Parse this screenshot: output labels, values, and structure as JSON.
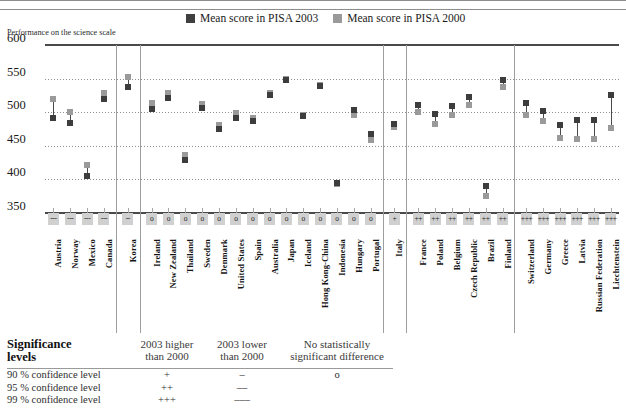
{
  "header": {
    "title_clipped": "",
    "axis_title": "Performance on the science scale"
  },
  "legend": {
    "items": [
      {
        "label": "Mean score in PISA 2003",
        "color": "#3f3f3f",
        "icon": "square-swatch-dark"
      },
      {
        "label": "Mean score in PISA 2000",
        "color": "#9a9a9a",
        "icon": "square-swatch-grey"
      }
    ]
  },
  "significance_legend": {
    "title_line1": "Significance",
    "title_line2": "levels",
    "col_headers": [
      {
        "line1": "2003 higher",
        "line2": "than 2000"
      },
      {
        "line1": "2003 lower",
        "line2": "than 2000"
      },
      {
        "line1": "No statistically",
        "line2": "significant difference"
      }
    ],
    "rows": [
      {
        "label": "90 % confidence level",
        "higher": "+",
        "lower": "–",
        "none": "o"
      },
      {
        "label": "95 % confidence level",
        "higher": "++",
        "lower": "––",
        "none": ""
      },
      {
        "label": "99 % confidence level",
        "higher": "+++",
        "lower": "–––",
        "none": ""
      }
    ]
  },
  "chart_data": {
    "type": "scatter",
    "title": "",
    "xlabel": "",
    "ylabel": "Performance on the science scale",
    "ylim": [
      350,
      600
    ],
    "yticks": [
      350,
      400,
      450,
      500,
      550,
      600
    ],
    "grid": true,
    "legend_position": "top-center",
    "categories": [
      "Austria",
      "Norway",
      "Mexico",
      "Canada",
      "Korea",
      "Ireland",
      "New Zealand",
      "Thailand",
      "Sweden",
      "Denmark",
      "United States",
      "Spain",
      "Australia",
      "Japan",
      "Iceland",
      "Hong Kong-China",
      "Indonesia",
      "Hungary",
      "Portugal",
      "Italy",
      "France",
      "Poland",
      "Belgium",
      "Czech Republic",
      "Brazil",
      "Finland",
      "Switzerland",
      "Germany",
      "Greece",
      "Latvia",
      "Russian Federation",
      "Liechtenstein"
    ],
    "series": [
      {
        "name": "Mean score in PISA 2003",
        "color": "#3d3d3d",
        "values": [
          491,
          484,
          405,
          519,
          538,
          505,
          521,
          429,
          506,
          475,
          491,
          487,
          525,
          548,
          495,
          539,
          395,
          503,
          468,
          483,
          511,
          498,
          509,
          523,
          390,
          548,
          513,
          502,
          481,
          489,
          489,
          525
        ]
      },
      {
        "name": "Mean score in PISA 2000",
        "color": "#9a9a9a",
        "values": [
          519,
          500,
          422,
          529,
          552,
          513,
          528,
          436,
          512,
          481,
          499,
          491,
          528,
          550,
          496,
          541,
          393,
          496,
          459,
          478,
          500,
          483,
          496,
          511,
          375,
          538,
          496,
          487,
          461,
          460,
          460,
          476
        ]
      }
    ],
    "significance": [
      "---",
      "---",
      "---",
      "---",
      "--",
      "o",
      "o",
      "o",
      "o",
      "o",
      "o",
      "o",
      "o",
      "o",
      "o",
      "o",
      "o",
      "o",
      "o",
      "+",
      "++",
      "++",
      "++",
      "++",
      "++",
      "++",
      "+++",
      "+++",
      "+++",
      "+++",
      "+++",
      "+++"
    ],
    "group_separators_after": [
      "Canada",
      "Korea",
      "Portugal",
      "Italy",
      "Finland"
    ]
  }
}
